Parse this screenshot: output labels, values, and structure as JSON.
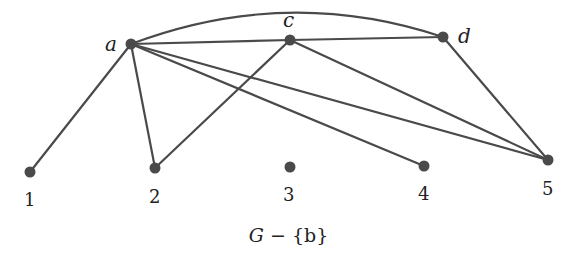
{
  "caption": {
    "graph": "G",
    "op": "−",
    "set": "{b}"
  },
  "graph": {
    "nodes": [
      {
        "id": "a",
        "label": "a",
        "x": 131,
        "y": 44,
        "label_x": 105,
        "label_y": 51,
        "italic": true
      },
      {
        "id": "c",
        "label": "c",
        "x": 290,
        "y": 40,
        "label_x": 283,
        "label_y": 27,
        "italic": true
      },
      {
        "id": "d",
        "label": "d",
        "x": 443,
        "y": 37,
        "label_x": 458,
        "label_y": 43,
        "italic": true
      },
      {
        "id": "1",
        "label": "1",
        "x": 30,
        "y": 172,
        "label_x": 24,
        "label_y": 206,
        "italic": false
      },
      {
        "id": "2",
        "label": "2",
        "x": 155,
        "y": 168,
        "label_x": 149,
        "label_y": 203,
        "italic": false
      },
      {
        "id": "3",
        "label": "3",
        "x": 290,
        "y": 167,
        "label_x": 283,
        "label_y": 201,
        "italic": false
      },
      {
        "id": "4",
        "label": "4",
        "x": 424,
        "y": 166,
        "label_x": 418,
        "label_y": 200,
        "italic": false
      },
      {
        "id": "5",
        "label": "5",
        "x": 548,
        "y": 160,
        "label_x": 542,
        "label_y": 195,
        "italic": false
      }
    ],
    "edges": [
      {
        "from": "a",
        "to": "c"
      },
      {
        "from": "c",
        "to": "d"
      },
      {
        "from": "a",
        "to": "d",
        "curved": true
      },
      {
        "from": "a",
        "to": "1"
      },
      {
        "from": "a",
        "to": "2"
      },
      {
        "from": "a",
        "to": "4"
      },
      {
        "from": "a",
        "to": "5"
      },
      {
        "from": "c",
        "to": "2"
      },
      {
        "from": "c",
        "to": "5"
      },
      {
        "from": "d",
        "to": "5"
      }
    ],
    "colors": {
      "edge": "#4a4a4a",
      "node": "#4a4a4a",
      "text": "#222222"
    }
  }
}
